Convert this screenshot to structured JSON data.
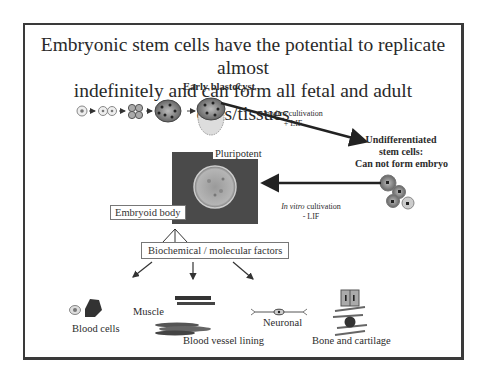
{
  "slide": {
    "title_line1": "Embryonic stem cells have the potential to replicate almost",
    "title_line2": "indefinitely and can form all fetal and adult cells/tissues"
  },
  "diagram": {
    "blastocyst_label": "Early blastocyst",
    "cultivation_plus": {
      "italic": "In vitro",
      "rest": " cultivation",
      "line2": "+ LIF"
    },
    "cultivation_minus": {
      "italic": "In vitro",
      "rest": " cultivation",
      "line2": "- LIF"
    },
    "undifferentiated": {
      "line1": "Undifferentiated",
      "line2": "stem cells:",
      "line3": "Can not form embryo"
    },
    "pluripotent_label": "Pluripotent",
    "embryoid_label": "Embryoid body",
    "factors_label": "Biochemical / molecular factors",
    "outcomes": {
      "blood_cells": "Blood cells",
      "muscle": "Muscle",
      "neuronal": "Neuronal",
      "blood_vessel": "Blood vessel lining",
      "bone": "Bone and cartilage"
    },
    "stages": [
      "zygote",
      "2-cell",
      "morula",
      "blastocyst",
      "early-blastocyst"
    ]
  },
  "colors": {
    "border": "#3a3a3a",
    "arrow": "#222222",
    "embryoid_bg": "#4a4a4a",
    "cell_gray": "#8a8a8a"
  }
}
